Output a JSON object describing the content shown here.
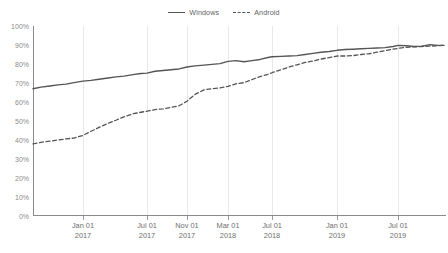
{
  "chart_data": {
    "type": "line",
    "title": "",
    "subtitle": "",
    "xlabel": "",
    "ylabel": "",
    "ylim": [
      0,
      100
    ],
    "ytick_labels": [
      "0%",
      "10%",
      "20%",
      "30%",
      "40%",
      "50%",
      "60%",
      "70%",
      "80%",
      "90%",
      "100%"
    ],
    "ytick_values": [
      0,
      10,
      20,
      30,
      40,
      50,
      60,
      70,
      80,
      90,
      100
    ],
    "grid": "vertical-only",
    "legend_position": "top-center",
    "xtick_labels": [
      {
        "line1": "Jan 01",
        "line2": "2017",
        "pos": 83
      },
      {
        "line1": "Jul 01",
        "line2": "2017",
        "pos": 147
      },
      {
        "line1": "Nov 01",
        "line2": "2017",
        "pos": 187
      },
      {
        "line1": "Mar 01",
        "line2": "2018",
        "pos": 228
      },
      {
        "line1": "Jul 01",
        "line2": "2018",
        "pos": 272
      },
      {
        "line1": "Jan 01",
        "line2": "2019",
        "pos": 337
      },
      {
        "line1": "Jul 01",
        "line2": "2019",
        "pos": 398
      }
    ],
    "series": [
      {
        "name": "Windows",
        "style": "solid",
        "color": "#555555",
        "points": [
          [
            33,
            67
          ],
          [
            41,
            67.8
          ],
          [
            50,
            68.4
          ],
          [
            58,
            69.0
          ],
          [
            66,
            69.4
          ],
          [
            74,
            70.2
          ],
          [
            83,
            71.0
          ],
          [
            91,
            71.4
          ],
          [
            99,
            72.0
          ],
          [
            108,
            72.6
          ],
          [
            116,
            73.2
          ],
          [
            124,
            73.6
          ],
          [
            133,
            74.4
          ],
          [
            141,
            75.0
          ],
          [
            147,
            75.2
          ],
          [
            155,
            76.2
          ],
          [
            163,
            76.6
          ],
          [
            171,
            77.0
          ],
          [
            179,
            77.4
          ],
          [
            187,
            78.4
          ],
          [
            195,
            79.0
          ],
          [
            204,
            79.4
          ],
          [
            212,
            79.8
          ],
          [
            220,
            80.2
          ],
          [
            228,
            81.4
          ],
          [
            236,
            81.8
          ],
          [
            244,
            81.2
          ],
          [
            252,
            81.8
          ],
          [
            260,
            82.4
          ],
          [
            268,
            83.4
          ],
          [
            272,
            83.8
          ],
          [
            281,
            84.0
          ],
          [
            289,
            84.2
          ],
          [
            297,
            84.4
          ],
          [
            305,
            85.0
          ],
          [
            313,
            85.6
          ],
          [
            321,
            86.2
          ],
          [
            329,
            86.6
          ],
          [
            337,
            87.2
          ],
          [
            345,
            87.6
          ],
          [
            353,
            87.8
          ],
          [
            361,
            88.0
          ],
          [
            369,
            88.2
          ],
          [
            377,
            88.4
          ],
          [
            385,
            88.6
          ],
          [
            393,
            89.2
          ],
          [
            398,
            89.8
          ],
          [
            406,
            89.6
          ],
          [
            414,
            89.2
          ],
          [
            422,
            89.4
          ],
          [
            430,
            90.2
          ],
          [
            438,
            89.8
          ],
          [
            444,
            89.8
          ]
        ]
      },
      {
        "name": "Android",
        "style": "dashed",
        "color": "#555555",
        "points": [
          [
            33,
            38
          ],
          [
            41,
            38.8
          ],
          [
            50,
            39.4
          ],
          [
            58,
            40.0
          ],
          [
            66,
            40.6
          ],
          [
            74,
            41.0
          ],
          [
            83,
            42.4
          ],
          [
            91,
            44.6
          ],
          [
            99,
            46.6
          ],
          [
            108,
            48.8
          ],
          [
            116,
            50.4
          ],
          [
            124,
            52.2
          ],
          [
            133,
            53.8
          ],
          [
            141,
            54.6
          ],
          [
            147,
            55.2
          ],
          [
            155,
            56.0
          ],
          [
            163,
            56.4
          ],
          [
            171,
            57.2
          ],
          [
            179,
            58.0
          ],
          [
            187,
            60.4
          ],
          [
            195,
            64.0
          ],
          [
            204,
            66.4
          ],
          [
            212,
            67.0
          ],
          [
            220,
            67.4
          ],
          [
            228,
            68.2
          ],
          [
            236,
            69.6
          ],
          [
            244,
            70.2
          ],
          [
            252,
            71.8
          ],
          [
            260,
            73.4
          ],
          [
            268,
            74.6
          ],
          [
            272,
            75.4
          ],
          [
            281,
            77.0
          ],
          [
            289,
            78.4
          ],
          [
            297,
            79.6
          ],
          [
            305,
            80.8
          ],
          [
            313,
            81.6
          ],
          [
            321,
            82.6
          ],
          [
            329,
            83.4
          ],
          [
            337,
            84.2
          ],
          [
            345,
            84.2
          ],
          [
            353,
            84.4
          ],
          [
            361,
            85.0
          ],
          [
            369,
            85.4
          ],
          [
            377,
            86.2
          ],
          [
            385,
            87.0
          ],
          [
            393,
            87.8
          ],
          [
            398,
            88.2
          ],
          [
            406,
            88.8
          ],
          [
            414,
            89.0
          ],
          [
            422,
            89.2
          ],
          [
            430,
            89.4
          ],
          [
            438,
            89.6
          ],
          [
            444,
            89.8
          ]
        ]
      }
    ]
  },
  "legend": {
    "entries": [
      {
        "label": "Windows",
        "style": "solid"
      },
      {
        "label": "Android",
        "style": "dashed"
      }
    ]
  },
  "footer": {
    "note": ""
  }
}
